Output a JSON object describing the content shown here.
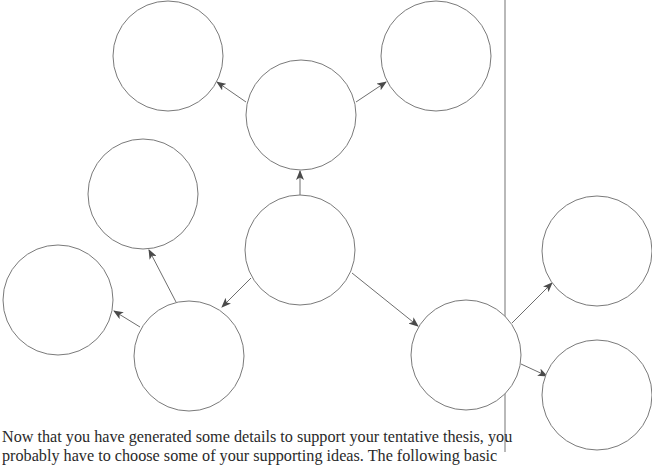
{
  "diagram": {
    "type": "cluster-map",
    "colors": {
      "circle_stroke": "#7a7a7a",
      "arrow": "#6e6e6e",
      "divider": "#b9b9b9",
      "text": "#2a2a2a"
    },
    "nodes": [
      {
        "id": "top-left",
        "cx": 168,
        "cy": 56,
        "r": 55
      },
      {
        "id": "top-right",
        "cx": 436,
        "cy": 56,
        "r": 55
      },
      {
        "id": "top-middle",
        "cx": 301,
        "cy": 115,
        "r": 55
      },
      {
        "id": "center",
        "cx": 300,
        "cy": 250,
        "r": 55
      },
      {
        "id": "middle-left",
        "cx": 143,
        "cy": 194,
        "r": 55
      },
      {
        "id": "far-left",
        "cx": 58,
        "cy": 300,
        "r": 55
      },
      {
        "id": "bottom-left",
        "cx": 189,
        "cy": 356,
        "r": 55
      },
      {
        "id": "bottom-right",
        "cx": 466,
        "cy": 355,
        "r": 55
      },
      {
        "id": "right-upper",
        "cx": 597,
        "cy": 251,
        "r": 55
      },
      {
        "id": "right-lower",
        "cx": 597,
        "cy": 395,
        "r": 55
      }
    ],
    "edges": [
      {
        "from": "center",
        "to": "top-middle",
        "x1": 300,
        "y1": 195,
        "x2": 300,
        "y2": 171
      },
      {
        "from": "top-middle",
        "to": "top-left",
        "x1": 246,
        "y1": 102,
        "x2": 217,
        "y2": 82
      },
      {
        "from": "top-middle",
        "to": "top-right",
        "x1": 356,
        "y1": 102,
        "x2": 386,
        "y2": 82
      },
      {
        "from": "center",
        "to": "bottom-left",
        "x1": 251,
        "y1": 278,
        "x2": 222,
        "y2": 307
      },
      {
        "from": "center",
        "to": "bottom-right",
        "x1": 352,
        "y1": 273,
        "x2": 418,
        "y2": 326
      },
      {
        "from": "bottom-left",
        "to": "middle-left",
        "x1": 176,
        "y1": 302,
        "x2": 149,
        "y2": 250
      },
      {
        "from": "bottom-left",
        "to": "far-left",
        "x1": 140,
        "y1": 327,
        "x2": 114,
        "y2": 311
      },
      {
        "from": "bottom-right",
        "to": "right-upper",
        "x1": 512,
        "y1": 323,
        "x2": 552,
        "y2": 283
      },
      {
        "from": "bottom-right",
        "to": "right-lower",
        "x1": 521,
        "y1": 364,
        "x2": 547,
        "y2": 376
      }
    ],
    "divider": {
      "x": 505,
      "y1": 0,
      "y2": 452
    }
  },
  "text": {
    "line1": "Now that you have generated some details to support your tentative thesis, you",
    "line2": "probably have to choose some of your supporting ideas. The following basic"
  }
}
